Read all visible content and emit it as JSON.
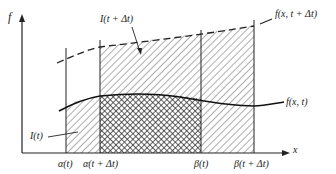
{
  "diagram": {
    "axis_labels": {
      "y": "f",
      "x": "x"
    },
    "curve_labels": {
      "f_t": "f(x, t)",
      "f_t_dt": "f(x, t + Δt)"
    },
    "region_labels": {
      "I_t": "I(t)",
      "I_t_dt": "I(t + Δt)"
    },
    "tick_labels": {
      "alpha_t": "α(t)",
      "alpha_t_dt": "α(t + Δt)",
      "beta_t": "β(t)",
      "beta_t_dt": "β(t + Δt)"
    },
    "colors": {
      "ink": "#222222",
      "background": "#ffffff"
    }
  }
}
